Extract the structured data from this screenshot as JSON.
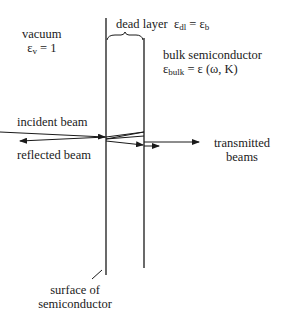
{
  "labels": {
    "vacuum": "vacuum",
    "vacuum_eps_symbol": "ε",
    "vacuum_eps_sub": "v",
    "vacuum_eps_value": " = 1",
    "dead_layer": "dead layer",
    "dead_eps_symbol": "ε",
    "dead_eps_sub": "dl",
    "dead_eps_eq": " = ε",
    "dead_eps_sub2": "b",
    "bulk": "bulk semiconductor",
    "bulk_eps_symbol": "ε",
    "bulk_eps_sub": "bulk",
    "bulk_eps_value": " = ε (ω, K)",
    "incident": "incident beam",
    "reflected": "reflected beam",
    "transmitted_1": "transmitted",
    "transmitted_2": "beams",
    "surface_1": "surface of",
    "surface_2": "semiconductor"
  },
  "colors": {
    "line": "#1a1a1a",
    "background": "#ffffff"
  }
}
